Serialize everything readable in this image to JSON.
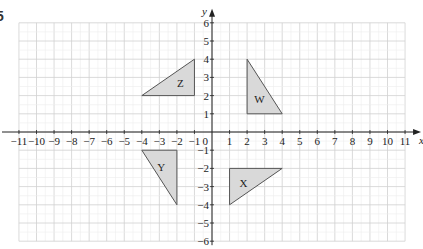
{
  "question_number": "5",
  "chart_data": {
    "type": "scatter",
    "title": "",
    "xlabel": "x",
    "ylabel": "y",
    "xlim": [
      -11,
      11
    ],
    "ylim": [
      -6,
      6
    ],
    "grid": true,
    "x_ticks": [
      -11,
      -10,
      -9,
      -8,
      -7,
      -6,
      -5,
      -4,
      -3,
      -2,
      -1,
      1,
      2,
      3,
      4,
      5,
      6,
      7,
      8,
      9,
      10,
      11
    ],
    "y_ticks": [
      -6,
      -5,
      -4,
      -3,
      -2,
      -1,
      1,
      2,
      3,
      4,
      5,
      6
    ],
    "origin_label": "0",
    "shapes": [
      {
        "name": "Z",
        "type": "triangle",
        "vertices": [
          [
            -4,
            2
          ],
          [
            -1,
            2
          ],
          [
            -1,
            4
          ]
        ],
        "label_pos": [
          -1.8,
          2.7
        ]
      },
      {
        "name": "W",
        "type": "triangle",
        "vertices": [
          [
            2,
            4
          ],
          [
            2,
            1
          ],
          [
            4,
            1
          ]
        ],
        "label_pos": [
          2.7,
          1.8
        ]
      },
      {
        "name": "Y",
        "type": "triangle",
        "vertices": [
          [
            -4,
            -1
          ],
          [
            -2,
            -1
          ],
          [
            -2,
            -4
          ]
        ],
        "label_pos": [
          -2.9,
          -1.9
        ]
      },
      {
        "name": "X",
        "type": "triangle",
        "vertices": [
          [
            1,
            -2
          ],
          [
            4,
            -2
          ],
          [
            1,
            -4
          ]
        ],
        "label_pos": [
          1.8,
          -2.8
        ]
      }
    ],
    "colors": {
      "fill": "#d9d9d9",
      "stroke": "#555555",
      "grid_major": "#d0d0d0",
      "grid_minor": "#ececec",
      "axis": "#222222"
    }
  }
}
